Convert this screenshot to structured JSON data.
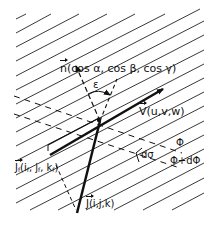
{
  "figure": {
    "type": "vector-field-diagram",
    "labels": {
      "normal_vector": "n",
      "normal_components": "(cos α, cos β, cos γ)",
      "angle": "ε",
      "velocity_vector": "V",
      "velocity_components": "(u,v,w)",
      "area_element": "dσ",
      "surface_phi": "Φ",
      "surface_phi_plus": "Φ+dΦ",
      "flux_f_vector": "J",
      "flux_f_sub": "f",
      "flux_f_components_open": "(i",
      "flux_f_i_sub": "f",
      "flux_f_comma1": ", j",
      "flux_f_j_sub": "f",
      "flux_f_comma2": ", k",
      "flux_f_k_sub": "f",
      "flux_f_close": ")",
      "flux_vector": "J",
      "flux_components": "(i,j,k)"
    },
    "colors": {
      "ink": "#111111",
      "background": "#ffffff"
    }
  }
}
